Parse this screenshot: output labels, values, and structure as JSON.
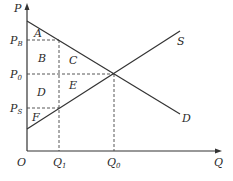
{
  "diagram": {
    "type": "supply-demand-tax-wedge",
    "axes": {
      "y_label": "P",
      "x_label": "Q",
      "origin_label": "O"
    },
    "price_labels": [
      {
        "main": "P",
        "sub": "B"
      },
      {
        "main": "P",
        "sub": "0"
      },
      {
        "main": "P",
        "sub": "S"
      }
    ],
    "quantity_labels": [
      {
        "main": "Q",
        "sub": "1"
      },
      {
        "main": "Q",
        "sub": "0"
      }
    ],
    "curves": {
      "supply": "S",
      "demand": "D"
    },
    "regions": [
      "A",
      "B",
      "C",
      "D",
      "E",
      "F"
    ],
    "colors": {
      "line": "#333333",
      "background": "#ffffff"
    }
  }
}
